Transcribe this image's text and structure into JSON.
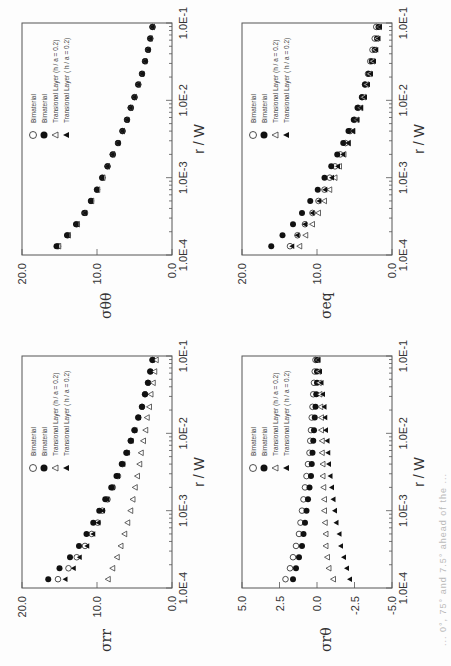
{
  "page": {
    "orientation": "rotated 90 degrees",
    "caption_fragment": "... 0°, 75° and 7.5° ahead of the ..."
  },
  "legend": {
    "items": [
      {
        "symbol": "open-circle",
        "label": "Bimaterial"
      },
      {
        "symbol": "filled-circle",
        "label": "Bimaterial"
      },
      {
        "symbol": "open-triangle",
        "label": "Transional Layer (h / a = 0.2)"
      },
      {
        "symbol": "filled-triangle",
        "label": "Transional Layer ( h / a = 0.2)"
      }
    ]
  },
  "chart_data": [
    {
      "type": "scatter",
      "id": "srr",
      "ylabel": "σrr",
      "xlabel": "r / W",
      "xscale": "log",
      "xlim": [
        0.0001,
        0.1
      ],
      "xticks": [
        "1.0E-4",
        "1.0E-3",
        "1.0E-2",
        "1.0E-1"
      ],
      "ylim": [
        0,
        20
      ],
      "yticks": [
        "0.0",
        "10.0",
        "20.0"
      ],
      "x": [
        0.00013,
        0.00018,
        0.00025,
        0.00035,
        0.0005,
        0.0007,
        0.001,
        0.0014,
        0.002,
        0.0028,
        0.004,
        0.0056,
        0.008,
        0.011,
        0.016,
        0.022,
        0.032,
        0.045,
        0.063,
        0.089
      ],
      "series": [
        {
          "name": "Bimaterial (open circle)",
          "values": [
            15.2,
            13.8,
            12.7,
            11.6,
            10.7,
            9.9,
            9.3,
            8.6,
            7.9,
            7.2,
            6.6,
            6.0,
            5.5,
            5.0,
            4.5,
            4.0,
            3.6,
            3.2,
            2.9,
            2.6
          ]
        },
        {
          "name": "Bimaterial (filled circle)",
          "values": [
            16.5,
            15.0,
            13.6,
            12.4,
            11.4,
            10.5,
            9.7,
            8.9,
            8.1,
            7.4,
            6.7,
            6.1,
            5.5,
            5.0,
            4.5,
            4.0,
            3.6,
            3.2,
            2.9,
            2.6
          ]
        },
        {
          "name": "Transional Layer open triangle (h/a=0.2)",
          "values": [
            8.5,
            7.9,
            7.3,
            6.8,
            6.3,
            5.9,
            5.5,
            5.2,
            4.9,
            4.6,
            4.3,
            4.1,
            3.8,
            3.5,
            3.3,
            3.0,
            2.8,
            2.5,
            2.3,
            2.1
          ]
        },
        {
          "name": "Transional Layer filled triangle (h/a=0.2)",
          "values": [
            14.2,
            13.1,
            12.3,
            11.3,
            10.5,
            9.8,
            9.2,
            8.6,
            7.9,
            7.2,
            6.5,
            5.9,
            5.4,
            4.9,
            4.4,
            4.0,
            3.6,
            3.2,
            2.9,
            2.6
          ]
        }
      ]
    },
    {
      "type": "scatter",
      "id": "stt",
      "ylabel": "σθθ",
      "xlabel": "r / W",
      "xscale": "log",
      "xlim": [
        0.0001,
        0.1
      ],
      "xticks": [
        "1.0E-4",
        "1.0E-3",
        "1.0E-2",
        "1.0E-1"
      ],
      "ylim": [
        0,
        20
      ],
      "yticks": [
        "0.0",
        "10.0",
        "20.0"
      ],
      "x": [
        0.00013,
        0.00018,
        0.00025,
        0.00035,
        0.0005,
        0.0007,
        0.001,
        0.0014,
        0.002,
        0.0028,
        0.004,
        0.0056,
        0.008,
        0.011,
        0.016,
        0.022,
        0.032,
        0.045,
        0.063,
        0.089
      ],
      "series": [
        {
          "name": "Bimaterial (open circle)",
          "values": [
            15.2,
            13.9,
            12.7,
            11.6,
            10.8,
            10.0,
            9.3,
            8.6,
            7.9,
            7.2,
            6.6,
            6.0,
            5.5,
            5.0,
            4.5,
            4.0,
            3.6,
            3.2,
            2.9,
            2.6
          ]
        },
        {
          "name": "Bimaterial (filled circle)",
          "values": [
            15.4,
            14.0,
            12.8,
            11.7,
            10.8,
            10.0,
            9.3,
            8.6,
            7.9,
            7.2,
            6.6,
            6.0,
            5.5,
            5.0,
            4.5,
            4.0,
            3.6,
            3.2,
            2.9,
            2.6
          ]
        },
        {
          "name": "Transional Layer open triangle (h/a=0.2)",
          "values": [
            15.1,
            13.8,
            12.6,
            11.6,
            10.7,
            9.9,
            9.2,
            8.6,
            7.9,
            7.2,
            6.6,
            6.0,
            5.5,
            5.0,
            4.5,
            4.0,
            3.6,
            3.2,
            2.9,
            2.6
          ]
        },
        {
          "name": "Transional Layer filled triangle (h/a=0.2)",
          "values": [
            15.3,
            13.9,
            12.7,
            11.6,
            10.8,
            10.0,
            9.3,
            8.6,
            7.9,
            7.2,
            6.6,
            6.0,
            5.5,
            5.0,
            4.5,
            4.0,
            3.6,
            3.2,
            2.9,
            2.6
          ]
        }
      ]
    },
    {
      "type": "scatter",
      "id": "srt",
      "ylabel": "σrθ",
      "xlabel": "r / W",
      "xscale": "log",
      "xlim": [
        0.0001,
        0.1
      ],
      "xticks": [
        "1.0E-4",
        "1.0E-3",
        "1.0E-2",
        "1.0E-1"
      ],
      "ylim": [
        -5,
        5
      ],
      "yticks": [
        "-5.0",
        "-2.5",
        "0.0",
        "2.5",
        "5.0"
      ],
      "x": [
        0.00013,
        0.00018,
        0.00025,
        0.00035,
        0.0005,
        0.0007,
        0.001,
        0.0014,
        0.002,
        0.0028,
        0.004,
        0.0056,
        0.008,
        0.011,
        0.016,
        0.022,
        0.032,
        0.045,
        0.063,
        0.089
      ],
      "series": [
        {
          "name": "Bimaterial (open circle)",
          "values": [
            2.1,
            1.8,
            1.6,
            1.4,
            1.2,
            1.1,
            1.0,
            0.9,
            0.8,
            0.7,
            0.6,
            0.5,
            0.45,
            0.4,
            0.35,
            0.3,
            0.25,
            0.2,
            0.15,
            0.1
          ]
        },
        {
          "name": "Bimaterial (filled circle)",
          "values": [
            1.6,
            1.4,
            1.2,
            1.0,
            0.9,
            0.8,
            0.7,
            0.6,
            0.5,
            0.4,
            0.35,
            0.3,
            0.25,
            0.2,
            0.15,
            0.1,
            0.05,
            0.0,
            0.0,
            0.0
          ]
        },
        {
          "name": "Transional Layer open triangle (h/a=0.2)",
          "values": [
            -1.1,
            -0.8,
            -0.7,
            -0.6,
            -0.6,
            -0.55,
            -0.5,
            -0.5,
            -0.45,
            -0.4,
            -0.4,
            -0.35,
            -0.35,
            -0.3,
            -0.3,
            -0.25,
            -0.2,
            -0.15,
            -0.1,
            -0.05
          ]
        },
        {
          "name": "Transional Layer filled triangle (h/a=0.2)",
          "values": [
            -2.2,
            -2.0,
            -1.8,
            -1.6,
            -1.5,
            -1.3,
            -1.2,
            -1.1,
            -1.0,
            -0.9,
            -0.8,
            -0.75,
            -0.7,
            -0.6,
            -0.55,
            -0.5,
            -0.4,
            -0.3,
            -0.2,
            -0.1
          ]
        }
      ]
    },
    {
      "type": "scatter",
      "id": "seq",
      "ylabel": "σeq",
      "xlabel": "r / W",
      "xscale": "log",
      "xlim": [
        0.0001,
        0.1
      ],
      "xticks": [
        "1.0E-4",
        "1.0E-3",
        "1.0E-2",
        "1.0E-1"
      ],
      "ylim": [
        0,
        20
      ],
      "yticks": [
        "0.0",
        "10.0",
        "20.0"
      ],
      "x": [
        0.00013,
        0.00018,
        0.00025,
        0.00035,
        0.0005,
        0.0007,
        0.001,
        0.0014,
        0.002,
        0.0028,
        0.004,
        0.0056,
        0.008,
        0.011,
        0.016,
        0.022,
        0.032,
        0.045,
        0.063,
        0.089
      ],
      "series": [
        {
          "name": "Bimaterial (open circle)",
          "values": [
            13.6,
            12.6,
            11.6,
            10.6,
            9.8,
            9.0,
            8.3,
            7.6,
            6.9,
            6.2,
            5.6,
            5.0,
            4.5,
            4.0,
            3.6,
            3.2,
            2.9,
            2.6,
            2.3,
            2.1
          ]
        },
        {
          "name": "Bimaterial (filled circle)",
          "values": [
            16.1,
            14.6,
            13.2,
            12.0,
            10.9,
            9.9,
            9.0,
            8.1,
            7.3,
            6.5,
            5.8,
            5.1,
            4.6,
            4.0,
            3.6,
            3.1,
            2.7,
            2.3,
            2.0,
            1.8
          ]
        },
        {
          "name": "Transional Layer open triangle (h/a=0.2)",
          "values": [
            12.3,
            11.5,
            10.6,
            9.8,
            9.0,
            8.3,
            7.6,
            7.0,
            6.4,
            5.8,
            5.2,
            4.7,
            4.2,
            3.8,
            3.4,
            3.0,
            2.6,
            2.3,
            2.0,
            1.7
          ]
        },
        {
          "name": "Transional Layer filled triangle (h/a=0.2)",
          "values": [
            13.3,
            12.6,
            11.6,
            10.6,
            9.7,
            8.9,
            8.0,
            7.2,
            6.5,
            5.8,
            5.2,
            4.6,
            4.1,
            3.6,
            3.2,
            2.8,
            2.4,
            2.1,
            1.8,
            1.6
          ]
        }
      ]
    }
  ]
}
